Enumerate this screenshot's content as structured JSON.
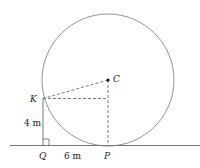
{
  "diagram": {
    "points": {
      "C": "C",
      "K": "K",
      "Q": "Q",
      "P": "P"
    },
    "measurements": {
      "KQ": "4 m",
      "QP": "6 m"
    },
    "colors": {
      "stroke": "#555555",
      "text": "#222222"
    }
  }
}
